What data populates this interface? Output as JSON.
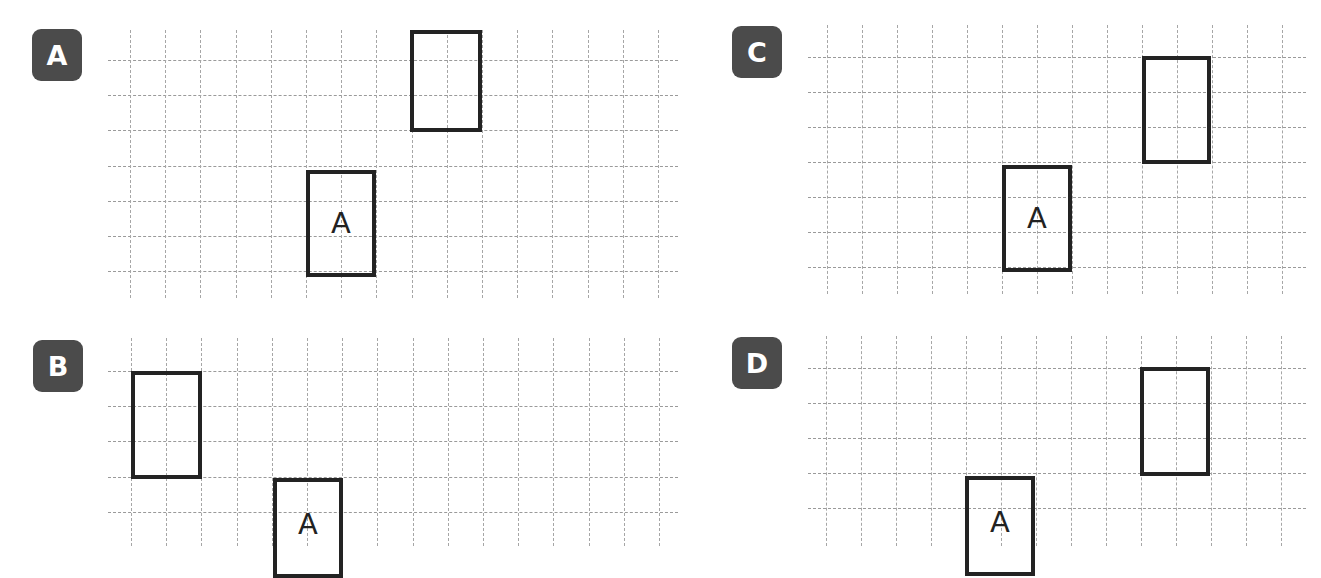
{
  "panels": [
    {
      "id": "A",
      "badge_label": "A",
      "grid": {
        "left": 108,
        "right": 678,
        "v_x0": 130,
        "v_count": 16,
        "v_top": 30,
        "v_bottom": 298,
        "h_y0": 60,
        "h_count": 7,
        "cell": 35.2
      },
      "shapes": [
        {
          "name": "image-rectangle",
          "label": "",
          "x": 410,
          "y": 30,
          "w": 72,
          "h": 102
        },
        {
          "name": "original-rectangle-A",
          "label": "A",
          "x": 306,
          "y": 170,
          "w": 70,
          "h": 107
        }
      ]
    },
    {
      "id": "C",
      "badge_label": "C",
      "grid": {
        "left": 808,
        "right": 1306,
        "v_x0": 827,
        "v_count": 14,
        "v_top": 25,
        "v_bottom": 294,
        "h_y0": 57,
        "h_count": 7,
        "cell": 35.0
      },
      "shapes": [
        {
          "name": "image-rectangle",
          "label": "",
          "x": 1142,
          "y": 56,
          "w": 69,
          "h": 108
        },
        {
          "name": "original-rectangle-A",
          "label": "A",
          "x": 1002,
          "y": 165,
          "w": 70,
          "h": 107
        }
      ]
    },
    {
      "id": "B",
      "badge_label": "B",
      "grid": {
        "left": 108,
        "right": 678,
        "v_x0": 131,
        "v_count": 16,
        "v_top": 338,
        "v_bottom": 546,
        "h_y0": 371,
        "h_count": 5,
        "cell": 35.2
      },
      "shapes": [
        {
          "name": "image-rectangle",
          "label": "",
          "x": 131,
          "y": 371,
          "w": 71,
          "h": 108
        },
        {
          "name": "original-rectangle-A",
          "label": "A",
          "x": 273,
          "y": 478,
          "w": 70,
          "h": 100
        }
      ]
    },
    {
      "id": "D",
      "badge_label": "D",
      "grid": {
        "left": 808,
        "right": 1306,
        "v_x0": 826,
        "v_count": 14,
        "v_top": 336,
        "v_bottom": 546,
        "h_y0": 368,
        "h_count": 5,
        "cell": 35.0
      },
      "shapes": [
        {
          "name": "image-rectangle",
          "label": "",
          "x": 1140,
          "y": 367,
          "w": 70,
          "h": 109
        },
        {
          "name": "original-rectangle-A",
          "label": "A",
          "x": 965,
          "y": 476,
          "w": 70,
          "h": 100
        }
      ]
    }
  ],
  "badges": {
    "A": {
      "label": "A",
      "x": 32,
      "y": 29
    },
    "B": {
      "label": "B",
      "x": 33,
      "y": 340
    },
    "C": {
      "label": "C",
      "x": 732,
      "y": 26
    },
    "D": {
      "label": "D",
      "x": 732,
      "y": 337
    }
  },
  "colors": {
    "badge_bg": "#4b4b4b",
    "badge_text": "#ffffff",
    "grid_line": "#9a9a9a",
    "shape_border": "#232323"
  }
}
